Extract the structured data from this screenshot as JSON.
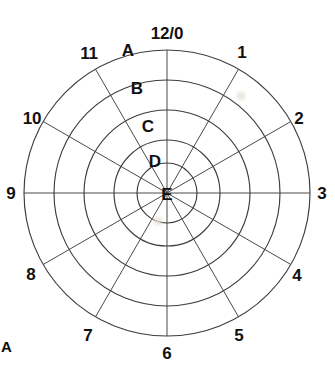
{
  "figure": {
    "panel_label": "A",
    "type": "polar-clock-diagram",
    "line_color": "#4a4a4a",
    "text_color": "#111111",
    "background": "#ffffff"
  },
  "chart_data": {
    "type": "polar",
    "title": "",
    "subtitle": "",
    "xlabel": "",
    "ylabel": "",
    "grid": true,
    "legend_position": "none",
    "center": {
      "x": 167,
      "y": 193
    },
    "spoke_count": 12,
    "ring_count": 5,
    "angular_axis": {
      "name": "clock-hours",
      "unit": "hour",
      "step_degrees": 30,
      "tick_labels": [
        "12/0",
        "1",
        "2",
        "3",
        "4",
        "5",
        "6",
        "7",
        "8",
        "9",
        "10",
        "11"
      ]
    },
    "radial_axis": {
      "name": "zones",
      "tick_labels": [
        "A",
        "B",
        "C",
        "D",
        "E"
      ],
      "radii": [
        143,
        113,
        83,
        53,
        30
      ],
      "direction": "outermost-to-innermost"
    },
    "rings": [
      {
        "label": "A",
        "radius": 143,
        "label_y": 50
      },
      {
        "label": "B",
        "radius": 113,
        "label_y": 88
      },
      {
        "label": "C",
        "radius": 83,
        "label_y": 125
      },
      {
        "label": "D",
        "radius": 53,
        "label_y": 162
      },
      {
        "label": "E",
        "radius": 30,
        "label_y": 193
      }
    ],
    "clock_positions": [
      {
        "label": "12/0",
        "hour": 0,
        "angle_deg": 0,
        "x": 167,
        "y": 33
      },
      {
        "label": "1",
        "hour": 1,
        "angle_deg": 30,
        "x": 242,
        "y": 52
      },
      {
        "label": "2",
        "hour": 2,
        "angle_deg": 60,
        "x": 299,
        "y": 118
      },
      {
        "label": "3",
        "hour": 3,
        "angle_deg": 90,
        "x": 322,
        "y": 193
      },
      {
        "label": "4",
        "hour": 4,
        "angle_deg": 120,
        "x": 297,
        "y": 275
      },
      {
        "label": "5",
        "hour": 5,
        "angle_deg": 150,
        "x": 239,
        "y": 335
      },
      {
        "label": "6",
        "hour": 6,
        "angle_deg": 180,
        "x": 167,
        "y": 353
      },
      {
        "label": "7",
        "hour": 7,
        "angle_deg": 210,
        "x": 88,
        "y": 335
      },
      {
        "label": "8",
        "hour": 8,
        "angle_deg": 240,
        "x": 31,
        "y": 274
      },
      {
        "label": "9",
        "hour": 9,
        "angle_deg": 270,
        "x": 11,
        "y": 193
      },
      {
        "label": "10",
        "hour": 10,
        "angle_deg": 300,
        "x": 32,
        "y": 118
      },
      {
        "label": "11",
        "hour": 11,
        "angle_deg": 330,
        "x": 89,
        "y": 53
      }
    ],
    "ring_label_positions": [
      {
        "label": "A",
        "x": 128,
        "y": 50
      },
      {
        "label": "B",
        "x": 137,
        "y": 88
      },
      {
        "label": "C",
        "x": 148,
        "y": 126
      },
      {
        "label": "D",
        "x": 155,
        "y": 161
      },
      {
        "label": "E",
        "x": 167,
        "y": 194
      }
    ],
    "artifacts": [
      {
        "name": "scan-smudge",
        "x": 241,
        "y": 96
      },
      {
        "name": "scan-smudge",
        "x": 158,
        "y": 221
      }
    ]
  }
}
